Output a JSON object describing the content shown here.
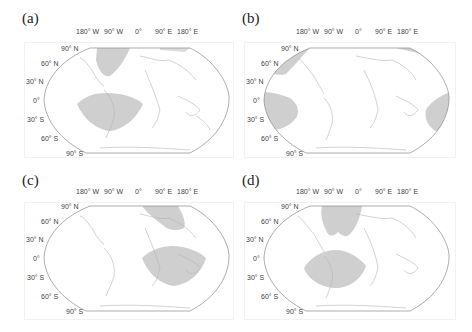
{
  "figure": {
    "panels": [
      {
        "label": "(a)"
      },
      {
        "label": "(b)"
      },
      {
        "label": "(c)"
      },
      {
        "label": "(d)"
      }
    ],
    "lon_ticks": [
      "180° W",
      "90° W",
      "0°",
      "90° E",
      "180° E"
    ],
    "lat_ticks": [
      "90° N",
      "60° N",
      "30° N",
      "0°",
      "30° S",
      "60° S",
      "90° S"
    ],
    "colors": {
      "shade": "#cfcfcf",
      "outline": "#8a8a8a",
      "coast": "#b5b5b5",
      "text": "#444444"
    }
  }
}
